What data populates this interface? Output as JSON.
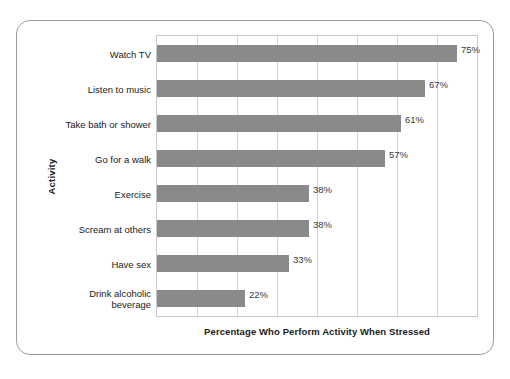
{
  "chart_data": {
    "type": "bar",
    "orientation": "horizontal",
    "title": "",
    "xlabel": "Percentage Who Perform Activity When Stressed",
    "ylabel": "Activity",
    "xlim": [
      0,
      80
    ],
    "grid": true,
    "gridline_step": 10,
    "legend": "none",
    "bar_color": "#8a8a8a",
    "categories": [
      "Watch TV",
      "Listen to music",
      "Take bath or shower",
      "Go for a walk",
      "Exercise",
      "Scream at others",
      "Have sex",
      "Drink alcoholic beverage"
    ],
    "values": [
      75,
      67,
      61,
      57,
      38,
      38,
      33,
      22
    ],
    "value_labels": [
      "75%",
      "67%",
      "61%",
      "57%",
      "38%",
      "38%",
      "33%",
      "22%"
    ]
  }
}
